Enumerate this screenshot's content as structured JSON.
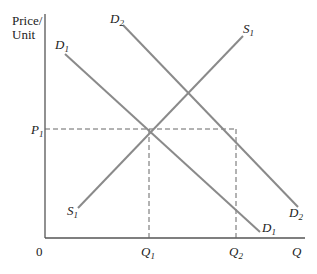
{
  "diagram": {
    "type": "supply-demand",
    "y_axis_label_line1": "Price/",
    "y_axis_label_line2": "Unit",
    "x_axis_label": "Q",
    "origin_label": "0",
    "price_label": "P",
    "price_sub": "1",
    "q1_label": "Q",
    "q1_sub": "1",
    "q2_label": "Q",
    "q2_sub": "2",
    "curves": {
      "d1_top": {
        "main": "D",
        "sub": "1"
      },
      "d1_bottom": {
        "main": "D",
        "sub": "1"
      },
      "d2_top": {
        "main": "D",
        "sub": "2"
      },
      "d2_bottom": {
        "main": "D",
        "sub": "2"
      },
      "s1_top": {
        "main": "S",
        "sub": "1"
      },
      "s1_bottom": {
        "main": "S",
        "sub": "1"
      }
    },
    "colors": {
      "curve": "#8a8a8a",
      "axis": "#555555",
      "dashed": "#666666",
      "text": "#222222"
    }
  }
}
